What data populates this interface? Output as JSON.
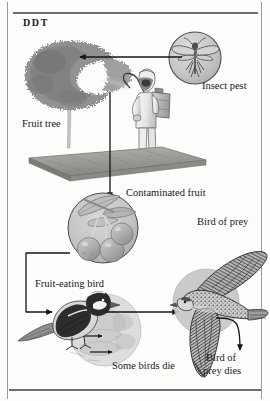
{
  "document": {
    "title": "DDT",
    "type": "diagram",
    "subject": "DDT bioaccumulation through a food chain"
  },
  "labels": {
    "insect_pest": "Insect pest",
    "fruit_tree": "Fruit tree",
    "contaminated_fruit": "Contaminated fruit",
    "bird_of_prey": "Bird of prey",
    "fruit_eating_bird": "Fruit-eating bird",
    "some_birds_die": "Some birds die",
    "bird_of_prey_dies_line1": "Bird of",
    "bird_of_prey_dies_line2": "prey dies"
  },
  "figures": {
    "insect": "mosquito-insect-illustration",
    "tree": "fruit-tree-illustration",
    "sprayer": "pesticide-sprayer-person-illustration",
    "ground": "ground-plane-illustration",
    "cherries": "contaminated-cherries-illustration",
    "songbird": "fruit-eating-bird-illustration",
    "dead_birds": "dying-birds-illustration",
    "falcon": "bird-of-prey-falcon-illustration"
  },
  "colors": {
    "ink": "#18181a",
    "rule": "#6f6f6b",
    "edge": "#9a9a96",
    "circle_fill": "#c9c9c9",
    "circle_stroke": "#5a5a5a",
    "foliage": "#8d8d8d",
    "ground": "#9d9d9a",
    "arrow": "#1a1a1a",
    "page": "#fdfdfc"
  },
  "flow": {
    "arrows": [
      {
        "name": "insect-to-tree",
        "from": "insect_pest",
        "to": "fruit_tree",
        "direction": "left"
      },
      {
        "name": "spray-to-fruit",
        "from": "sprayer",
        "to": "contaminated_fruit",
        "direction": "down"
      },
      {
        "name": "fruit-to-bird",
        "from": "contaminated_fruit",
        "to": "fruit_eating_bird",
        "direction": "elbow-left-down-right"
      },
      {
        "name": "bird-to-prey",
        "from": "fruit_eating_bird",
        "to": "bird_of_prey",
        "direction": "right"
      },
      {
        "name": "prey-to-death",
        "from": "bird_of_prey",
        "to": "bird_of_prey_dies",
        "direction": "curve-down"
      }
    ]
  }
}
